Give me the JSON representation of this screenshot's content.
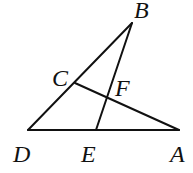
{
  "diagram": {
    "type": "geometry",
    "points": {
      "A": {
        "label": "A",
        "x": 179,
        "y": 130,
        "lx": 170,
        "ly": 162
      },
      "B": {
        "label": "B",
        "x": 132,
        "y": 23,
        "lx": 134,
        "ly": 18
      },
      "C": {
        "label": "C",
        "x": 75,
        "y": 83,
        "lx": 52,
        "ly": 86
      },
      "D": {
        "label": "D",
        "x": 28,
        "y": 130,
        "lx": 13,
        "ly": 162
      },
      "E": {
        "label": "E",
        "x": 96,
        "y": 130,
        "lx": 81,
        "ly": 162
      },
      "F": {
        "label": "F",
        "x": 107,
        "y": 97,
        "lx": 115,
        "ly": 96
      }
    },
    "segments": [
      {
        "name": "segment-DB",
        "from": "D",
        "to": "B"
      },
      {
        "name": "segment-DA",
        "from": "D",
        "to": "A"
      },
      {
        "name": "segment-EB",
        "from": "E",
        "to": "B"
      },
      {
        "name": "segment-CA",
        "from": "C",
        "to": "A"
      }
    ]
  }
}
